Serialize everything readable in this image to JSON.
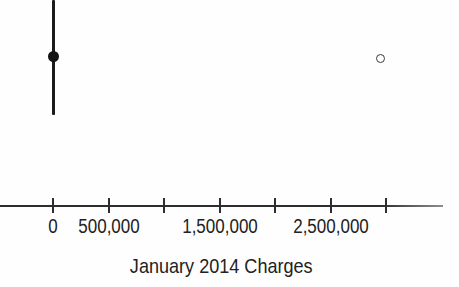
{
  "chart_data": {
    "type": "boxplot",
    "orientation": "horizontal",
    "xlabel": "January 2014 Charges",
    "xlim": [
      -480000,
      3510000
    ],
    "grid": false,
    "x_ticks": [
      {
        "value": 0,
        "label": "0"
      },
      {
        "value": 500000,
        "label": "500,000"
      },
      {
        "value": 1000000,
        "label": ""
      },
      {
        "value": 1500000,
        "label": "1,500,000"
      },
      {
        "value": 2000000,
        "label": ""
      },
      {
        "value": 2500000,
        "label": "2,500,000"
      },
      {
        "value": 3000000,
        "label": ""
      }
    ],
    "box": {
      "whisker_low": 0,
      "q1": 0,
      "median": 0,
      "q3": 0,
      "whisker_high": 0,
      "median_marker": "filled-circle"
    },
    "outliers": [
      {
        "value": 2950000,
        "marker": "open-circle"
      }
    ]
  },
  "colors": {
    "background": "#ffffff",
    "ink": "#1b1b1b",
    "axis": "#2d2d2d"
  }
}
